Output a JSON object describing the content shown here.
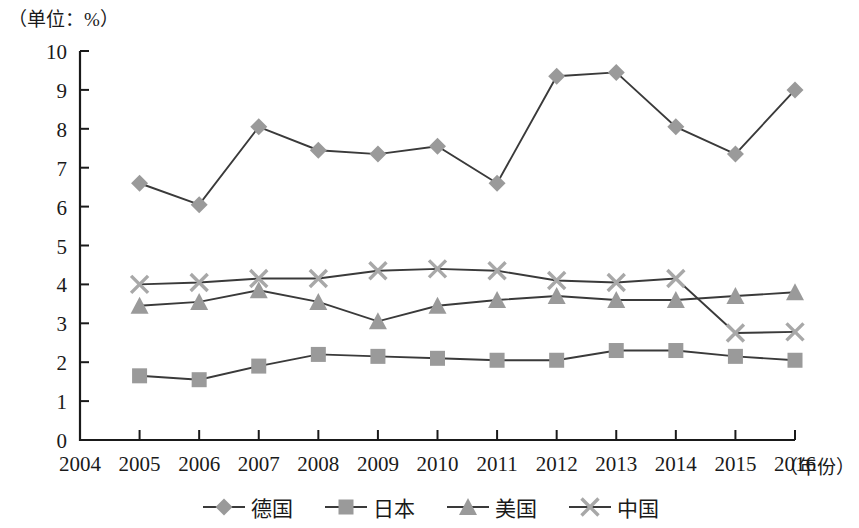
{
  "unit_label": "（单位：%）",
  "x_axis_title": "（年份）",
  "legend": {
    "items": [
      {
        "label": "德国",
        "marker": "diamond-marker"
      },
      {
        "label": "日本",
        "marker": "square-marker"
      },
      {
        "label": "美国",
        "marker": "triangle-marker"
      },
      {
        "label": "中国",
        "marker": "x-marker"
      }
    ]
  },
  "chart_data": {
    "type": "line",
    "title": "",
    "subtitle": "",
    "xlabel": "（年份）",
    "ylabel": "（单位：%）",
    "x": [
      "2004",
      "2005",
      "2006",
      "2007",
      "2008",
      "2009",
      "2010",
      "2011",
      "2012",
      "2013",
      "2014",
      "2015",
      "2016"
    ],
    "categories": [
      "2005",
      "2006",
      "2007",
      "2008",
      "2009",
      "2010",
      "2011",
      "2012",
      "2013",
      "2014",
      "2015",
      "2016"
    ],
    "xtick_labels": [
      "2004",
      "2005",
      "2006",
      "2007",
      "2008",
      "2009",
      "2010",
      "2011",
      "2012",
      "2013",
      "2014",
      "2015",
      "2016"
    ],
    "ytick_labels": [
      "0",
      "1",
      "2",
      "3",
      "4",
      "5",
      "6",
      "7",
      "8",
      "9",
      "10"
    ],
    "ylim": [
      0,
      10
    ],
    "ystep": 1,
    "grid": false,
    "legend_position": "bottom",
    "series": [
      {
        "name": "德国",
        "marker": "diamond",
        "color": "#9a9a9a",
        "values": [
          6.6,
          6.05,
          8.05,
          7.45,
          7.35,
          7.55,
          6.6,
          9.35,
          9.45,
          8.05,
          7.35,
          9.0
        ]
      },
      {
        "name": "日本",
        "marker": "square",
        "color": "#9a9a9a",
        "values": [
          1.65,
          1.55,
          1.9,
          2.2,
          2.15,
          2.1,
          2.05,
          2.05,
          2.3,
          2.3,
          2.15,
          2.05
        ]
      },
      {
        "name": "美国",
        "marker": "triangle",
        "color": "#9a9a9a",
        "values": [
          3.45,
          3.55,
          3.85,
          3.55,
          3.05,
          3.45,
          3.6,
          3.7,
          3.6,
          3.6,
          3.7,
          3.8
        ]
      },
      {
        "name": "中国",
        "marker": "x",
        "color": "#a8a8a8",
        "values": [
          4.0,
          4.05,
          4.15,
          4.15,
          4.35,
          4.4,
          4.35,
          4.1,
          4.05,
          4.15,
          2.75,
          2.78
        ]
      }
    ]
  }
}
